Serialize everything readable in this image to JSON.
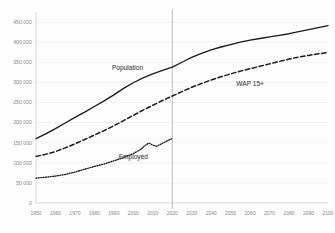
{
  "chart_data": {
    "type": "line",
    "title": "",
    "subtitle": "",
    "xlabel": "",
    "ylabel": "",
    "xlim": [
      1950,
      2100
    ],
    "ylim": [
      0,
      475000
    ],
    "grid": true,
    "legend_position": "inline-annotations",
    "x_ticks": [
      1950,
      1960,
      1970,
      1980,
      1990,
      2000,
      2010,
      2020,
      2030,
      2040,
      2050,
      2060,
      2070,
      2080,
      2090,
      2100
    ],
    "x_tick_labels": [
      "1950",
      "1960",
      "1970",
      "1980",
      "1990",
      "2000",
      "2010",
      "2020",
      "2030",
      "2040",
      "2050",
      "2060",
      "2070",
      "2080",
      "2090",
      "2100"
    ],
    "y_ticks": [
      0,
      50000,
      100000,
      150000,
      200000,
      250000,
      300000,
      350000,
      400000,
      450000
    ],
    "y_tick_labels": [
      "0",
      "50 000",
      "100 000",
      "150 000",
      "200 000",
      "250 000",
      "300 000",
      "350 000",
      "400 000",
      "450 000"
    ],
    "reference_line": {
      "x": 2020,
      "color": "#bdbdbd",
      "label": ""
    },
    "annotations": [
      {
        "text": "Population",
        "x": 1997,
        "y": 330000
      },
      {
        "text": "WAP 15+",
        "x": 2060,
        "y": 290000
      },
      {
        "text": "Employed",
        "x": 2000,
        "y": 110000
      }
    ],
    "series": [
      {
        "name": "Population",
        "style": "solid",
        "color": "#1a1a1a",
        "x": [
          1950,
          1955,
          1960,
          1965,
          1970,
          1975,
          1980,
          1985,
          1990,
          1995,
          2000,
          2005,
          2010,
          2015,
          2020,
          2025,
          2030,
          2035,
          2040,
          2045,
          2050,
          2055,
          2060,
          2065,
          2070,
          2075,
          2080,
          2085,
          2090,
          2095,
          2100
        ],
        "values": [
          160000,
          172000,
          185000,
          199000,
          213000,
          226000,
          240000,
          254000,
          269000,
          285000,
          299000,
          311000,
          321000,
          330000,
          338000,
          350000,
          362000,
          372000,
          381000,
          388000,
          394000,
          400000,
          405000,
          409000,
          413000,
          417000,
          421000,
          426000,
          431000,
          436000,
          441000
        ]
      },
      {
        "name": "WAP 15+",
        "style": "dashed",
        "color": "#1a1a1a",
        "x": [
          1950,
          1955,
          1960,
          1965,
          1970,
          1975,
          1980,
          1985,
          1990,
          1995,
          2000,
          2005,
          2010,
          2015,
          2020,
          2025,
          2030,
          2035,
          2040,
          2045,
          2050,
          2055,
          2060,
          2065,
          2070,
          2075,
          2080,
          2085,
          2090,
          2095,
          2100
        ],
        "values": [
          116000,
          121000,
          128000,
          137000,
          147000,
          158000,
          169000,
          180000,
          192000,
          205000,
          218000,
          231000,
          243000,
          255000,
          266000,
          277000,
          288000,
          297000,
          306000,
          314000,
          321000,
          328000,
          334000,
          340000,
          346000,
          352000,
          358000,
          363000,
          367000,
          371000,
          374000
        ]
      },
      {
        "name": "Employed",
        "style": "dotted",
        "color": "#1a1a1a",
        "x": [
          1950,
          1955,
          1960,
          1965,
          1970,
          1975,
          1980,
          1985,
          1990,
          1995,
          2000,
          2004,
          2006,
          2008,
          2010,
          2012,
          2014,
          2016,
          2018,
          2020
        ],
        "values": [
          62000,
          64000,
          67000,
          71000,
          77000,
          84000,
          91000,
          97000,
          105000,
          113000,
          123000,
          134000,
          143000,
          149000,
          144000,
          141000,
          146000,
          151000,
          156000,
          160000
        ]
      }
    ]
  }
}
